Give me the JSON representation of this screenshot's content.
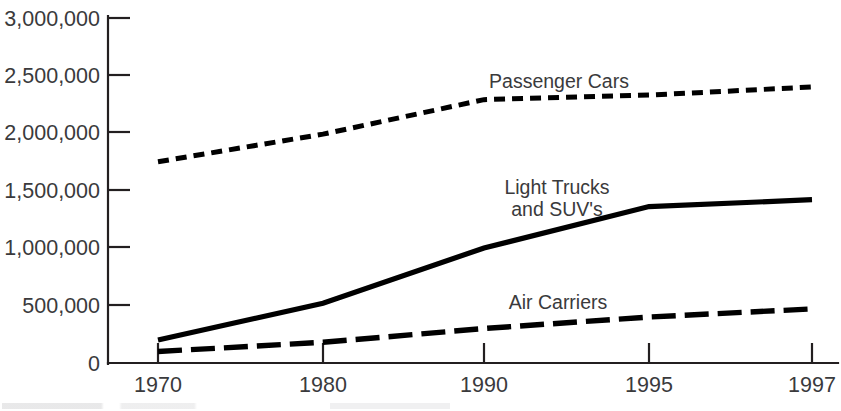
{
  "chart_data": {
    "type": "line",
    "title": "",
    "subtitle": "",
    "xlabel": "",
    "ylabel": "",
    "categories": [
      "1970",
      "1980",
      "1990",
      "1995",
      "1997"
    ],
    "x_tick_labels": [
      "1970",
      "1980",
      "1990",
      "1995",
      "1997"
    ],
    "y_tick_labels": [
      "0",
      "500,000",
      "1,000,000",
      "1,500,000",
      "2,000,000",
      "2,500,000",
      "3,000,000"
    ],
    "y_tick_values": [
      0,
      500000,
      1000000,
      1500000,
      2000000,
      2500000,
      3000000
    ],
    "ylim": [
      0,
      3000000
    ],
    "grid": false,
    "legend": "inline-annotations",
    "series": [
      {
        "name": "Passenger Cars",
        "label": "Passenger Cars",
        "style": "dotted",
        "color": "#000000",
        "values": [
          1750000,
          1990000,
          2290000,
          2330000,
          2400000
        ]
      },
      {
        "name": "Light Trucks and SUV's",
        "label_line1": "Light Trucks",
        "label_line2": "and SUV's",
        "style": "solid",
        "color": "#000000",
        "values": [
          200000,
          520000,
          1000000,
          1360000,
          1420000
        ]
      },
      {
        "name": "Air Carriers",
        "label": "Air Carriers",
        "style": "dashed",
        "color": "#000000",
        "values": [
          100000,
          180000,
          300000,
          400000,
          470000
        ]
      }
    ],
    "annotations": [
      {
        "text": "Passenger Cars",
        "x": 559,
        "y": 88
      },
      {
        "text": "Light Trucks",
        "x": 557,
        "y": 194
      },
      {
        "text": "and SUV's",
        "x": 557,
        "y": 216
      },
      {
        "text": "Air Carriers",
        "x": 558,
        "y": 309
      }
    ]
  },
  "axes": {
    "y_ticks": [
      {
        "label": "3,000,000",
        "y": 18
      },
      {
        "label": "2,500,000",
        "y": 75
      },
      {
        "label": "2,000,000",
        "y": 132
      },
      {
        "label": "1,500,000",
        "y": 190
      },
      {
        "label": "1,000,000",
        "y": 247
      },
      {
        "label": "500,000",
        "y": 305
      },
      {
        "label": "0",
        "y": 363
      }
    ],
    "x_ticks": [
      {
        "label": "1970",
        "x": 158
      },
      {
        "label": "1980",
        "x": 323
      },
      {
        "label": "1990",
        "x": 484
      },
      {
        "label": "1995",
        "x": 649
      },
      {
        "label": "1997",
        "x": 812
      }
    ]
  }
}
